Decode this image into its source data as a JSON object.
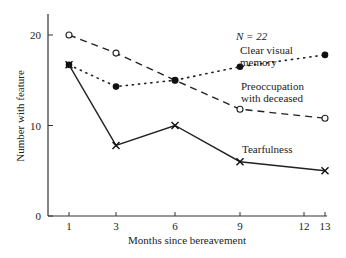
{
  "chart_data": {
    "type": "line",
    "title": "",
    "xlabel": "Months since bereavement",
    "ylabel": "Number with feature",
    "x": [
      1,
      3,
      6,
      9,
      13
    ],
    "xticks": [
      1,
      3,
      6,
      9,
      12,
      13
    ],
    "yticks": [
      0,
      10,
      20
    ],
    "xlim": [
      0,
      13
    ],
    "ylim": [
      0,
      22
    ],
    "grid": false,
    "annotation": "N = 22",
    "series": [
      {
        "name": "Preoccupation with deceased",
        "style": "dashed",
        "marker": "open-circle",
        "values": [
          20,
          18,
          15,
          11.8,
          10.8
        ]
      },
      {
        "name": "Clear visual memory",
        "style": "dotted",
        "marker": "filled-circle",
        "values": [
          16.7,
          14.3,
          15,
          16.5,
          17.8
        ]
      },
      {
        "name": "Tearfulness",
        "style": "solid",
        "marker": "x",
        "values": [
          16.7,
          7.8,
          10,
          6,
          5
        ]
      }
    ]
  },
  "labels": {
    "n": "N = 22",
    "clear1": "Clear visual",
    "clear2": "memory",
    "preoc1": "Preoccupation",
    "preoc2": "with deceased",
    "tear": "Tearfulness",
    "xlabel": "Months since bereavement",
    "ylabel": "Number with feature",
    "xt": [
      "1",
      "3",
      "6",
      "9",
      "12",
      "13"
    ],
    "yt": [
      "0",
      "10",
      "20"
    ]
  }
}
